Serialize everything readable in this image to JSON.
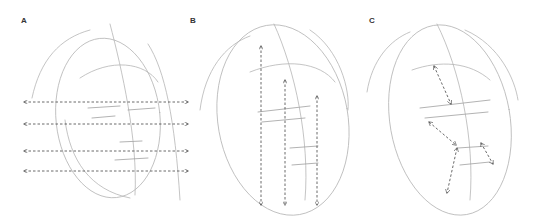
{
  "figure": {
    "panels": [
      {
        "label": "A",
        "description": "Horizontal dashed double-arrow guidelines across the face",
        "arrow_count": 4,
        "arrow_direction": "horizontal"
      },
      {
        "label": "B",
        "description": "Vertical dashed double-arrow guidelines down the face",
        "arrow_count": 3,
        "arrow_direction": "vertical"
      },
      {
        "label": "C",
        "description": "Diagonal dashed double-arrow guidelines between facial features",
        "arrow_count": 4,
        "arrow_direction": "diagonal"
      }
    ],
    "colors": {
      "sketch": "#b5b5b5",
      "arrow": "#444444",
      "background": "#ffffff"
    }
  }
}
